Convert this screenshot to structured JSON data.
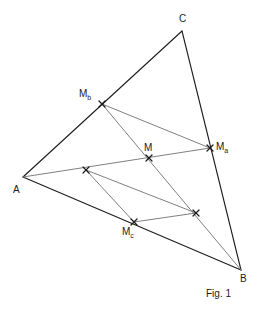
{
  "figure": {
    "caption": "Fig. 1",
    "colors": {
      "outline": "#1c1c1c",
      "inner": "#808080",
      "marker": "#1c1c1c",
      "background": "#ffffff"
    },
    "stroke_widths": {
      "outline": 1.1,
      "inner": 1.0
    },
    "vertices": [
      {
        "id": "A",
        "label": "A",
        "sub": "",
        "x": 23,
        "y": 177,
        "label_x": 13,
        "label_y": 185,
        "marker": false
      },
      {
        "id": "B",
        "label": "B",
        "sub": "",
        "x": 241,
        "y": 270,
        "label_x": 240,
        "label_y": 274,
        "marker": false
      },
      {
        "id": "C",
        "label": "C",
        "sub": "",
        "x": 182,
        "y": 31,
        "label_x": 179,
        "label_y": 14,
        "marker": false
      }
    ],
    "midpoints": [
      {
        "id": "Ma",
        "label": "M",
        "sub": "a",
        "x": 210,
        "y": 148,
        "label_x": 216,
        "label_y": 142,
        "marker": true,
        "on_side": "CB"
      },
      {
        "id": "Mb",
        "label": "M",
        "sub": "b",
        "x": 102,
        "y": 104,
        "label_x": 79,
        "label_y": 89,
        "marker": true,
        "on_side": "AC"
      },
      {
        "id": "Mc",
        "label": "M",
        "sub": "c",
        "x": 134,
        "y": 222,
        "label_x": 122,
        "label_y": 227,
        "marker": true,
        "on_side": "AB"
      }
    ],
    "centroid": {
      "id": "M",
      "label": "M",
      "sub": "",
      "x": 149,
      "y": 158,
      "label_x": 144,
      "label_y": 143,
      "marker": true
    },
    "unlabeled_points": [
      {
        "id": "P1",
        "x": 86,
        "y": 170,
        "marker": true
      },
      {
        "id": "P2",
        "x": 196,
        "y": 213,
        "marker": true
      }
    ],
    "outline_edges": [
      {
        "id": "edge-AC",
        "from": "A",
        "to": "C"
      },
      {
        "id": "edge-CB",
        "from": "C",
        "to": "B"
      },
      {
        "id": "edge-AB",
        "from": "A",
        "to": "B"
      }
    ],
    "inner_segments": [
      {
        "id": "median-A-Ma",
        "from": "A",
        "to": "Ma"
      },
      {
        "id": "median-Mb-B",
        "from": "Mb",
        "to": "B"
      },
      {
        "id": "midline-Mb-Ma",
        "from": "Mb",
        "to": "Ma"
      },
      {
        "id": "seg-P1-P2",
        "from": "P1",
        "to": "P2"
      },
      {
        "id": "seg-P1-Mc",
        "from": "P1",
        "to": "Mc"
      },
      {
        "id": "seg-Mc-P2",
        "from": "Mc",
        "to": "P2"
      }
    ]
  }
}
